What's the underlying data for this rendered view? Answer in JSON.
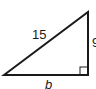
{
  "diagram": {
    "type": "right-triangle",
    "stroke_color": "#1a1a1a",
    "background": "#ffffff",
    "vertices": {
      "left": [
        4,
        75
      ],
      "top_right": [
        88,
        12
      ],
      "bottom_right": [
        88,
        75
      ]
    },
    "right_angle_marker": {
      "x": 80,
      "y": 67,
      "size": 8
    },
    "labels": {
      "hypotenuse": "15",
      "vertical_leg": "9",
      "base": "b"
    }
  }
}
